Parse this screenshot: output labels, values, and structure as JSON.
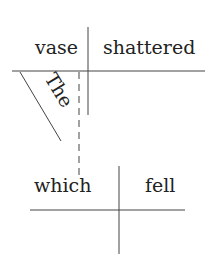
{
  "diagram": {
    "type": "sentence-diagram",
    "main_clause": {
      "subject": "vase",
      "verb": "shattered",
      "modifier": "The"
    },
    "relative_clause": {
      "subject": "which",
      "verb": "fell"
    },
    "connector": "dashed"
  }
}
